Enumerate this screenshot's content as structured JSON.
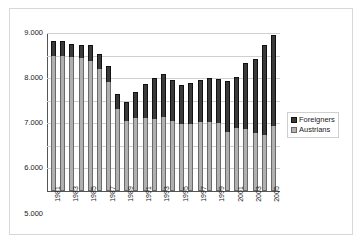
{
  "chart_data": {
    "type": "bar",
    "stacked": true,
    "title": "",
    "subtitle": "",
    "xlabel": "",
    "ylabel": "",
    "ylim": [
      2000,
      9000
    ],
    "ytick_labels": [
      "9.000",
      "8.000",
      "7.000",
      "6.000",
      "5.000",
      "4.000",
      "3.000",
      "2.000"
    ],
    "ytick_values": [
      9000,
      8000,
      7000,
      6000,
      5000,
      4000,
      3000,
      2000
    ],
    "grid": true,
    "legend_position": "right",
    "categories": [
      "1981",
      "1982",
      "1983",
      "1984",
      "1985",
      "1986",
      "1987",
      "1988",
      "1989",
      "1990",
      "1991",
      "1992",
      "1993",
      "1994",
      "1995",
      "1996",
      "1997",
      "1998",
      "1999",
      "2000",
      "2001",
      "2002",
      "2003",
      "2004",
      "2005"
    ],
    "xtick_labels": [
      "1981",
      "",
      "1983",
      "",
      "1985",
      "",
      "1987",
      "",
      "1989",
      "",
      "1991",
      "",
      "1993",
      "",
      "1995",
      "",
      "1997",
      "",
      "1999",
      "",
      "2001",
      "",
      "2003",
      "",
      "2005"
    ],
    "series": [
      {
        "name": "Austrians",
        "color": "#b0b0b0",
        "values": [
          8000,
          8000,
          7950,
          7880,
          7780,
          7400,
          6850,
          5650,
          5100,
          5250,
          5250,
          5200,
          5300,
          5100,
          4950,
          4950,
          5050,
          5050,
          5000,
          4600,
          4800,
          4750,
          4550,
          4500,
          4900
        ]
      },
      {
        "name": "Foreigners",
        "color": "#3a3a3a",
        "values": [
          640,
          630,
          570,
          590,
          690,
          650,
          710,
          660,
          860,
          1150,
          1500,
          1800,
          1900,
          1800,
          1750,
          1850,
          1870,
          1970,
          1980,
          2270,
          2260,
          2930,
          3300,
          3950,
          4000
        ]
      }
    ],
    "totals": [
      8640,
      8630,
      8520,
      8470,
      8470,
      8050,
      7560,
      6310,
      5960,
      6400,
      6750,
      7000,
      7200,
      6900,
      6700,
      6800,
      6920,
      7020,
      6980,
      6870,
      7060,
      7680,
      7850,
      8450,
      8900
    ],
    "legend": [
      {
        "label": "Foreigners",
        "swatch": "foreign"
      },
      {
        "label": "Austrians",
        "swatch": "austrian"
      }
    ]
  }
}
